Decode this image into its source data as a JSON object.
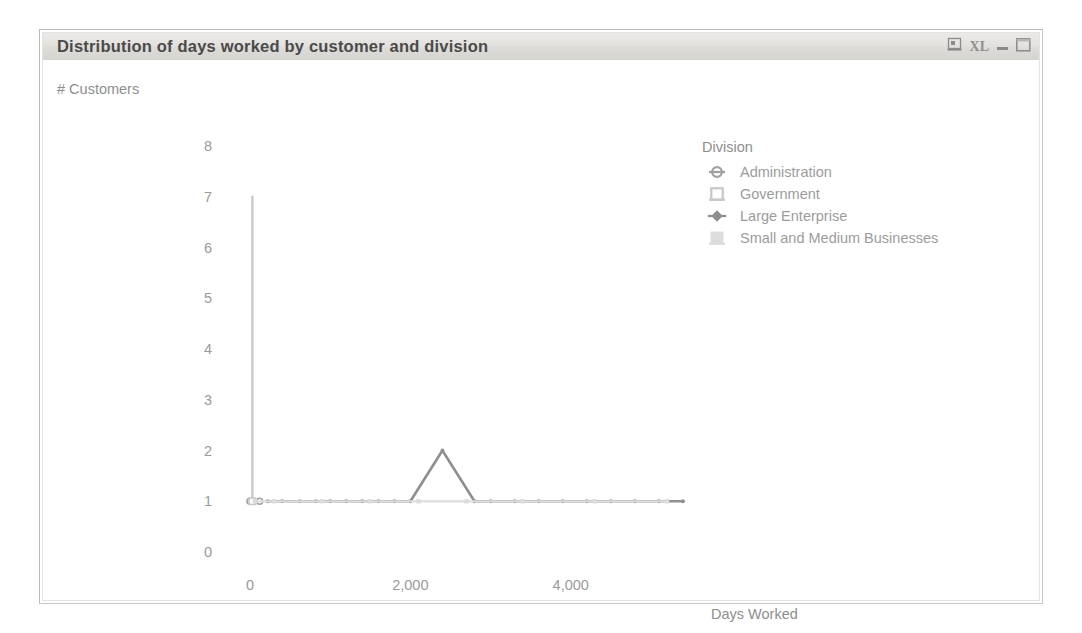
{
  "window": {
    "title": "Distribution of days worked by customer and division",
    "controls": [
      {
        "name": "export-report-icon",
        "label": ""
      },
      {
        "name": "excel-export-icon",
        "label": "XL"
      },
      {
        "name": "minimize-button",
        "label": ""
      },
      {
        "name": "maximize-button",
        "label": ""
      }
    ]
  },
  "chart_data": {
    "type": "line",
    "title": "Distribution of days worked by customer and division",
    "xlabel": "Days Worked",
    "ylabel": "# Customers",
    "xlim": [
      -250,
      5600
    ],
    "ylim": [
      0,
      8
    ],
    "xticks": [
      "0",
      "2,000",
      "4,000"
    ],
    "xtickvalues": [
      0,
      2000,
      4000
    ],
    "yticks": [
      "0",
      "1",
      "2",
      "3",
      "4",
      "5",
      "6",
      "7",
      "8"
    ],
    "ytickvalues": [
      0,
      1,
      2,
      3,
      4,
      5,
      6,
      7,
      8
    ],
    "grid": false,
    "legend_position": "right",
    "legend_title": "Division",
    "series": [
      {
        "name": "Administration",
        "marker": "circle-open",
        "color": "#a0a0a0",
        "points": [
          [
            0,
            1
          ],
          [
            120,
            1
          ]
        ]
      },
      {
        "name": "Government",
        "marker": "square-open",
        "color": "#c9c9c9",
        "points": [
          [
            30,
            1
          ],
          [
            30,
            7
          ]
        ]
      },
      {
        "name": "Large Enterprise",
        "marker": "diamond-filled",
        "color": "#8f8f8f",
        "points": [
          [
            220,
            1
          ],
          [
            400,
            1
          ],
          [
            620,
            1
          ],
          [
            820,
            1
          ],
          [
            1000,
            1
          ],
          [
            1200,
            1
          ],
          [
            1400,
            1
          ],
          [
            1600,
            1
          ],
          [
            1800,
            1
          ],
          [
            2000,
            1
          ],
          [
            2400,
            2
          ],
          [
            2800,
            1
          ],
          [
            3000,
            1
          ],
          [
            3300,
            1
          ],
          [
            3600,
            1
          ],
          [
            3900,
            1
          ],
          [
            4200,
            1
          ],
          [
            4500,
            1
          ],
          [
            4800,
            1
          ],
          [
            5100,
            1
          ],
          [
            5400,
            1
          ]
        ]
      },
      {
        "name": "Small and Medium Businesses",
        "marker": "square-light",
        "color": "#dcdcdc",
        "points": [
          [
            60,
            1
          ],
          [
            300,
            1
          ],
          [
            900,
            1
          ],
          [
            1500,
            1
          ],
          [
            2100,
            1
          ],
          [
            2700,
            1
          ],
          [
            3400,
            1
          ],
          [
            4300,
            1
          ],
          [
            5200,
            1
          ]
        ]
      }
    ]
  }
}
